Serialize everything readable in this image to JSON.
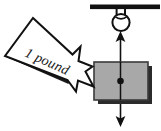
{
  "figure": {
    "name": "hanging-block-force-diagram",
    "background_color": "#ffffff",
    "width": 161,
    "height": 131
  },
  "labels": {
    "applied_force": "1 pound"
  },
  "colors": {
    "ink": "#111111",
    "block_fill": "#a8a8a8",
    "block_edge": "#3a3a3a",
    "shadow": "#2b2b2b",
    "arrow_fill": "#ffffff",
    "arrow_stroke": "#111111",
    "ceiling": "#111111"
  },
  "elements": {
    "ceiling_bar": {
      "name": "ceiling-support-bar",
      "x1": 90,
      "y1": 6,
      "x2": 160,
      "y2": 6,
      "thickness": 5
    },
    "hook_ring": {
      "name": "ceiling-hook-ring",
      "cx": 121,
      "cy": 22,
      "r": 8.5,
      "stem_left_x": 117,
      "stem_right_x": 125,
      "stem_top_y": 8,
      "stem_bottom_y": 19
    },
    "block": {
      "name": "suspended-block",
      "x": 94,
      "y": 62,
      "width": 54,
      "height": 38,
      "shadow_offset": 4,
      "center_dot": {
        "cx": 120.5,
        "cy": 81,
        "r": 3.2
      }
    },
    "tension_arrow_up": {
      "name": "upward-tension-force-arrow",
      "x": 120.5,
      "tail_y": 100,
      "head_y": 32,
      "head_width": 9,
      "head_length": 9
    },
    "weight_arrow_down": {
      "name": "downward-weight-force-arrow",
      "x": 120.5,
      "tail_y": 62,
      "head_y": 126,
      "head_width": 9,
      "head_length": 9
    },
    "applied_force_arrow": {
      "name": "applied-force-block-arrow",
      "direction": "down-right",
      "label_rotation_deg": 24
    }
  }
}
